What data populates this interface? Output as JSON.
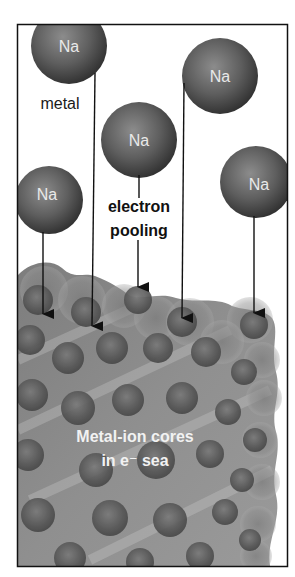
{
  "diagram": {
    "atoms": [
      {
        "label": "Na",
        "cx": 69,
        "cy": 46,
        "r": 38
      },
      {
        "label": "Na",
        "cx": 220,
        "cy": 76,
        "r": 38
      },
      {
        "label": "Na",
        "cx": 139,
        "cy": 140,
        "r": 38
      },
      {
        "label": "Na",
        "cx": 49,
        "cy": 200,
        "r": 33
      },
      {
        "label": "Na",
        "cx": 256,
        "cy": 182,
        "r": 35
      }
    ],
    "labels": {
      "metal": "metal",
      "electron": "electron",
      "pooling": "pooling",
      "sea_line1": "Metal-ion cores",
      "sea_line2": "in e⁻ sea"
    },
    "arrows": [
      {
        "from": "Na (left)",
        "to": "lattice"
      },
      {
        "from": "Na (top-left)",
        "to": "lattice"
      },
      {
        "from": "electron pooling",
        "to": "lattice"
      },
      {
        "from": "Na (top-right)",
        "to": "lattice"
      },
      {
        "from": "Na (right)",
        "to": "lattice"
      }
    ],
    "colors": {
      "atom_dark": "#3c3c3c",
      "atom_mid": "#6e6e6e",
      "atom_light": "#8f8f8f",
      "lattice_base": "#8a8a8a",
      "frame": "#111111",
      "background": "#ffffff"
    }
  }
}
